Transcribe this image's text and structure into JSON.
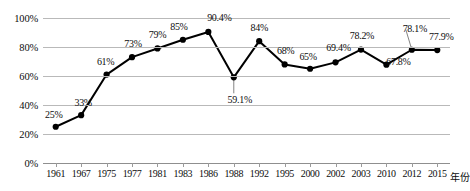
{
  "chart_data": {
    "type": "line",
    "title": "",
    "xlabel": "年份",
    "ylabel": "",
    "categories": [
      "1961",
      "1967",
      "1975",
      "1977",
      "1981",
      "1983",
      "1986",
      "1988",
      "1992",
      "1995",
      "2000",
      "2002",
      "2003",
      "2010",
      "2012",
      "2015"
    ],
    "values": [
      25,
      33,
      61,
      73,
      79,
      85,
      90.4,
      59.1,
      84,
      68,
      65,
      69.4,
      78.2,
      67.8,
      78.1,
      77.9
    ],
    "point_labels": [
      "25%",
      "33%",
      "61%",
      "73%",
      "79%",
      "85%",
      "90.4%",
      "59.1%",
      "84%",
      "68%",
      "65%",
      "69.4%",
      "78.2%",
      "67.8%",
      "78.1%",
      "77.9%"
    ],
    "ylim": [
      0,
      100
    ],
    "yticks": [
      0,
      20,
      40,
      60,
      80,
      100
    ],
    "ytick_labels": [
      "0%",
      "20%",
      "40%",
      "60%",
      "80%",
      "100%"
    ],
    "grid": true,
    "legend": "none",
    "series_color": "#000000",
    "grid_color": "#b9b9b9",
    "marker": "filled-circle"
  },
  "axes": {
    "x_axis_title": "年份"
  }
}
